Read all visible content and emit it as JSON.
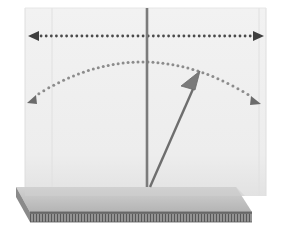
{
  "figure": {
    "type": "physics-diagram",
    "width": 285,
    "height": 230,
    "background_color": "#ffffff"
  },
  "colors": {
    "background": "#ffffff",
    "panel_fill": "#f0f0f0",
    "panel_fill_lower": "#e4e4e4",
    "panel_edge": "#dcdcdc",
    "slab_top": "#bfbfbf",
    "slab_top_light": "#cfcfcf",
    "slab_front": "#6f6f6f",
    "slab_side": "#8a8a8a",
    "slab_hatch_band": "#8f8f8f",
    "slab_hatch_line": "#5a5a5a",
    "pole": "#7b7b7b",
    "vector_arrow": "#6e6e6e",
    "dotted_arc": "#8c8c8c",
    "dotted_axis": "#4a4a4a",
    "arrowhead_dark": "#3f3f3f"
  },
  "elements": {
    "base_slab": {
      "name": "base-slab",
      "description": "3D rectangular base plate drawn in oblique perspective",
      "top_face": [
        [
          16,
          187
        ],
        [
          236,
          187
        ],
        [
          252,
          212
        ],
        [
          30,
          212
        ]
      ],
      "front_face": [
        [
          30,
          212
        ],
        [
          252,
          212
        ],
        [
          252,
          222
        ],
        [
          30,
          222
        ]
      ],
      "left_face": [
        [
          16,
          187
        ],
        [
          30,
          212
        ],
        [
          30,
          222
        ],
        [
          16,
          197
        ]
      ],
      "hatch_band": [
        [
          30,
          214
        ],
        [
          252,
          214
        ],
        [
          252,
          222
        ],
        [
          30,
          222
        ]
      ],
      "hatch_count": 74
    },
    "back_panel": {
      "name": "translucent-back-panel",
      "description": "Light translucent vertical plane behind the pendulum",
      "front_rect": [
        [
          25,
          8
        ],
        [
          266,
          8
        ],
        [
          266,
          196
        ],
        [
          25,
          196
        ]
      ],
      "inner_edge_x": 52,
      "right_inner_edge_x": 259
    },
    "pole": {
      "name": "vertical-pole",
      "description": "Vertical reference post rising from the base",
      "x": 147,
      "y_top": 8,
      "y_bottom": 187,
      "width": 2.6
    },
    "vector_arrow": {
      "name": "pendulum-vector-arrow",
      "description": "Solid arrow from the pivot at the base angled up and to the right",
      "start": [
        150,
        187
      ],
      "end": [
        200,
        73
      ],
      "shaft_width": 2.4,
      "head_length": 26,
      "head_width": 19
    },
    "swing_arc": {
      "name": "swing-range-dotted-arc",
      "description": "Dotted arc with arrowheads at both ends showing the sweep range",
      "left_end": [
        29,
        100
      ],
      "right_end": [
        258,
        101
      ],
      "apex": [
        143,
        62
      ],
      "dot_radius": 1.5,
      "dot_count": 46,
      "left_arrow_angle_deg": 215,
      "right_arrow_angle_deg": 325
    },
    "horizontal_axis": {
      "name": "horizontal-dotted-double-arrow",
      "description": "Horizontal dotted double-headed arrow across the top of the panel",
      "y": 36,
      "x_start": 30,
      "x_end": 262,
      "dot_radius": 1.4,
      "dot_spacing": 5.1,
      "head_length": 10,
      "head_width": 11
    }
  },
  "chart_data": {
    "type": "diagram",
    "annotations": [
      "horizontal span arrow at top of plane",
      "dotted semicircular swing arc with end arrowheads",
      "solid pendulum vector tilted right of vertical",
      "vertical reference pole",
      "3D base plate with hatched front edge"
    ]
  }
}
